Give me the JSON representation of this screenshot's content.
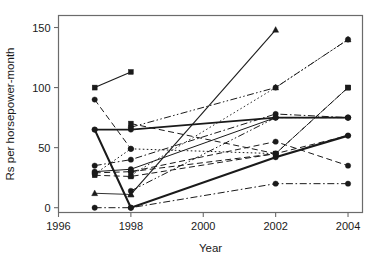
{
  "chart_data": {
    "type": "line",
    "title": "",
    "xlabel": "Year",
    "ylabel": "Rs per horsepower-month",
    "xlim": [
      1996,
      2004.4
    ],
    "ylim": [
      -4,
      160
    ],
    "xticks": [
      1996,
      1998,
      2000,
      2002,
      2004
    ],
    "xtick_labels": [
      "1996",
      "1998",
      "2000",
      "2002",
      "2004"
    ],
    "yticks": [
      0,
      50,
      100,
      150
    ],
    "ytick_labels": [
      "0",
      "50",
      "100",
      "150"
    ],
    "grid": false,
    "legend": "none",
    "frame": "box",
    "series": [
      {
        "name": "series-1",
        "marker": "square",
        "linestyle": "solid",
        "linewidth": 1.1,
        "x": [
          1997,
          1998
        ],
        "values": [
          100,
          113
        ]
      },
      {
        "name": "series-2",
        "marker": "circle",
        "linestyle": "dashed",
        "linewidth": 1.0,
        "x": [
          1997,
          1998
        ],
        "values": [
          90,
          49
        ]
      },
      {
        "name": "series-3",
        "marker": "circle",
        "linestyle": "solid",
        "linewidth": 2.1,
        "x": [
          1997,
          1998,
          2002,
          2004
        ],
        "values": [
          65,
          0,
          42,
          60
        ]
      },
      {
        "name": "series-4",
        "marker": "circle",
        "linestyle": "solid",
        "linewidth": 1.9,
        "x": [
          1997,
          1998,
          2002,
          2004
        ],
        "values": [
          65,
          65,
          75,
          75
        ]
      },
      {
        "name": "series-5",
        "marker": "circle",
        "linestyle": "dashdotdot",
        "linewidth": 1.0,
        "x": [
          1998,
          2002,
          2004
        ],
        "values": [
          67,
          100,
          140
        ]
      },
      {
        "name": "series-6",
        "marker": "square",
        "linestyle": "dashed",
        "linewidth": 1.0,
        "x": [
          1998,
          2002,
          2004
        ],
        "values": [
          70,
          45,
          100
        ]
      },
      {
        "name": "series-7",
        "marker": "triangle",
        "linestyle": "solid",
        "linewidth": 1.1,
        "x": [
          1998,
          2002
        ],
        "values": [
          11,
          148
        ]
      },
      {
        "name": "series-8",
        "marker": "triangle",
        "linestyle": "solid",
        "linewidth": 0.9,
        "x": [
          1997,
          1998
        ],
        "values": [
          12,
          11
        ]
      },
      {
        "name": "series-9",
        "marker": "triangle",
        "linestyle": "dotted",
        "linewidth": 0.9,
        "x": [
          1998,
          2002,
          2004
        ],
        "values": [
          27,
          100,
          140
        ]
      },
      {
        "name": "series-10",
        "marker": "circle",
        "linestyle": "dashdot",
        "linewidth": 1.0,
        "x": [
          1997,
          1998,
          2002,
          2004
        ],
        "values": [
          0,
          0,
          20,
          20
        ]
      },
      {
        "name": "series-11",
        "marker": "circle",
        "linestyle": "dotted",
        "linewidth": 1.0,
        "x": [
          1997,
          1998,
          2002
        ],
        "values": [
          28,
          49,
          45
        ]
      },
      {
        "name": "series-12",
        "marker": "square",
        "linestyle": "dashed",
        "linewidth": 1.0,
        "x": [
          1997,
          1998,
          2002,
          2004
        ],
        "values": [
          27,
          26,
          45,
          100
        ]
      },
      {
        "name": "series-13",
        "marker": "circle",
        "linestyle": "dashdot",
        "linewidth": 1.0,
        "x": [
          1997,
          1998,
          2002,
          2004
        ],
        "values": [
          35,
          40,
          78,
          75
        ]
      },
      {
        "name": "series-14",
        "marker": "circle",
        "linestyle": "solid",
        "linewidth": 1.0,
        "x": [
          1997,
          1998,
          2002,
          2004
        ],
        "values": [
          30,
          32,
          75,
          75
        ]
      },
      {
        "name": "series-15",
        "marker": "circle",
        "linestyle": "dashed",
        "linewidth": 1.0,
        "x": [
          1997,
          1998,
          2002,
          2004
        ],
        "values": [
          29,
          30,
          55,
          35
        ]
      },
      {
        "name": "series-16",
        "marker": "circle",
        "linestyle": "dashdotdot",
        "linewidth": 1.0,
        "x": [
          1998,
          2002,
          2004
        ],
        "values": [
          14,
          75,
          75
        ]
      },
      {
        "name": "series-17",
        "marker": "circle",
        "linestyle": "dashed",
        "linewidth": 1.0,
        "x": [
          1998,
          2002,
          2004
        ],
        "values": [
          30,
          45,
          60
        ]
      }
    ]
  }
}
